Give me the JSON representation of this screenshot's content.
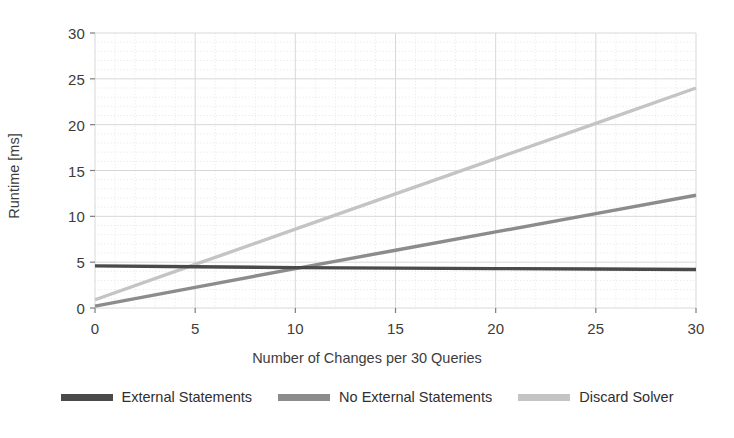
{
  "chart_data": {
    "type": "line",
    "title": "",
    "xlabel": "Number of Changes per 30 Queries",
    "ylabel": "Runtime [ms]",
    "xlim": [
      0,
      30
    ],
    "ylim": [
      0,
      30
    ],
    "xticks": [
      "0",
      "5",
      "10",
      "15",
      "20",
      "25",
      "30"
    ],
    "yticks": [
      "0",
      "5",
      "10",
      "15",
      "20",
      "25",
      "30"
    ],
    "xtick_values": [
      0,
      5,
      10,
      15,
      20,
      25,
      30
    ],
    "ytick_values": [
      0,
      5,
      10,
      15,
      20,
      25,
      30
    ],
    "grid": true,
    "legend_position": "bottom",
    "x": [
      0,
      5,
      10,
      15,
      20,
      25,
      30
    ],
    "series": [
      {
        "name": "External Statements",
        "color": "#4a4a4a",
        "values": [
          4.6,
          4.5,
          4.4,
          4.35,
          4.3,
          4.25,
          4.2
        ]
      },
      {
        "name": "No External Statements",
        "color": "#8c8c8c",
        "values": [
          0.2,
          2.25,
          4.3,
          6.3,
          8.3,
          10.3,
          12.3
        ]
      },
      {
        "name": "Discard Solver",
        "color": "#c4c4c4",
        "values": [
          0.9,
          4.75,
          8.6,
          12.45,
          16.3,
          20.15,
          24.0
        ]
      }
    ]
  },
  "legend": {
    "items": [
      {
        "label": "External Statements",
        "swatch": "line-swatch-external-statements"
      },
      {
        "label": "No External Statements",
        "swatch": "line-swatch-no-external-statements"
      },
      {
        "label": "Discard Solver",
        "swatch": "line-swatch-discard-solver"
      }
    ]
  },
  "colors": {
    "series_1": "#4a4a4a",
    "series_2": "#8c8c8c",
    "series_3": "#c4c4c4",
    "grid_major": "#d8d8d8",
    "grid_minor": "#e6e6e6",
    "axis": "#9a9a9a",
    "text": "#3c3c3c",
    "background": "#ffffff"
  }
}
